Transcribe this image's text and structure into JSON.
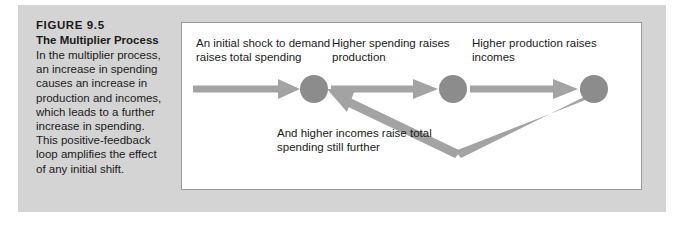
{
  "figure": {
    "number": "FIGURE 9.5",
    "title": "The Multiplier Process",
    "caption": "In the multiplier process, an increase in spending causes an increase in production and incomes, which leads to a further increase in spending. This positive-feedback loop amplifies the effect of any initial shift."
  },
  "diagram": {
    "labels": {
      "initial_shock": "An initial shock to demand raises total spending",
      "higher_spending": "Higher spending raises production",
      "higher_production": "Higher production raises incomes",
      "feedback": "And higher incomes raise total spending still further"
    },
    "nodes": [
      {
        "name": "node-1",
        "cx": 132,
        "cy": 66,
        "r": 14
      },
      {
        "name": "node-2",
        "cx": 271,
        "cy": 66,
        "r": 14
      },
      {
        "name": "node-3",
        "cx": 412,
        "cy": 66,
        "r": 14
      }
    ],
    "colors": {
      "node_fill": "#8c8c8c",
      "arrow": "#a3a3a3",
      "panel_background": "#d4d4d4",
      "diagram_background": "#ffffff",
      "diagram_border": "#9a9a9a",
      "text": "#1a1a1a"
    }
  }
}
